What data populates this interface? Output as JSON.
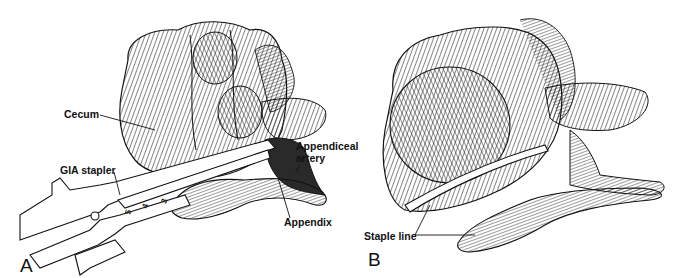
{
  "figure": {
    "panels": [
      {
        "id": "A",
        "letter": "A",
        "labels": {
          "cecum": "Cecum",
          "gia_stapler": "GIA stapler",
          "appendiceal_artery_line1": "Appendiceal",
          "appendiceal_artery_line2": "artery",
          "appendix": "Appendix"
        },
        "stapler_scale_ticks": [
          "5",
          "4",
          "3"
        ]
      },
      {
        "id": "B",
        "letter": "B",
        "labels": {
          "staple_line": "Staple line"
        }
      }
    ],
    "colors": {
      "ink": "#111111",
      "background": "#ffffff"
    }
  }
}
